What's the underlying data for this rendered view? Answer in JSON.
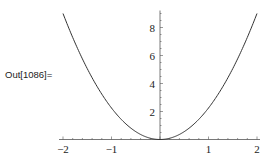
{
  "cell": {
    "output_label": "Out[1086]="
  },
  "chart_data": {
    "type": "line",
    "title": "",
    "xlabel": "",
    "ylabel": "",
    "xlim": [
      -2,
      2
    ],
    "ylim": [
      0,
      9
    ],
    "grid": false,
    "legend": null,
    "x_ticks": [
      -2,
      -1,
      1,
      2
    ],
    "x_tick_labels": [
      "−2",
      "−1",
      "1",
      "2"
    ],
    "y_ticks": [
      2,
      4,
      6,
      8
    ],
    "y_tick_labels": [
      "2",
      "4",
      "6",
      "8"
    ],
    "series": [
      {
        "name": "parabola",
        "color": "#333333",
        "x": [
          -2,
          -1.5,
          -1,
          -0.5,
          0,
          0.5,
          1,
          1.5,
          2
        ],
        "y": [
          9,
          5.06,
          2.25,
          0.56,
          0,
          0.56,
          2.25,
          5.06,
          9
        ]
      }
    ]
  }
}
